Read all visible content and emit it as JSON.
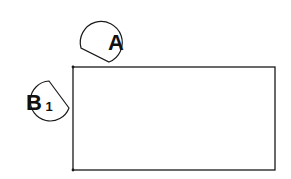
{
  "diagram": {
    "rectangle": {
      "x": 73,
      "y": 67,
      "width": 202,
      "height": 103
    },
    "callouts": [
      {
        "id": "A",
        "label": "A",
        "subscript": ""
      },
      {
        "id": "B1",
        "label": "B",
        "subscript": "1"
      }
    ]
  },
  "colors": {
    "stroke": "#1a1a1a",
    "background": "#ffffff"
  }
}
